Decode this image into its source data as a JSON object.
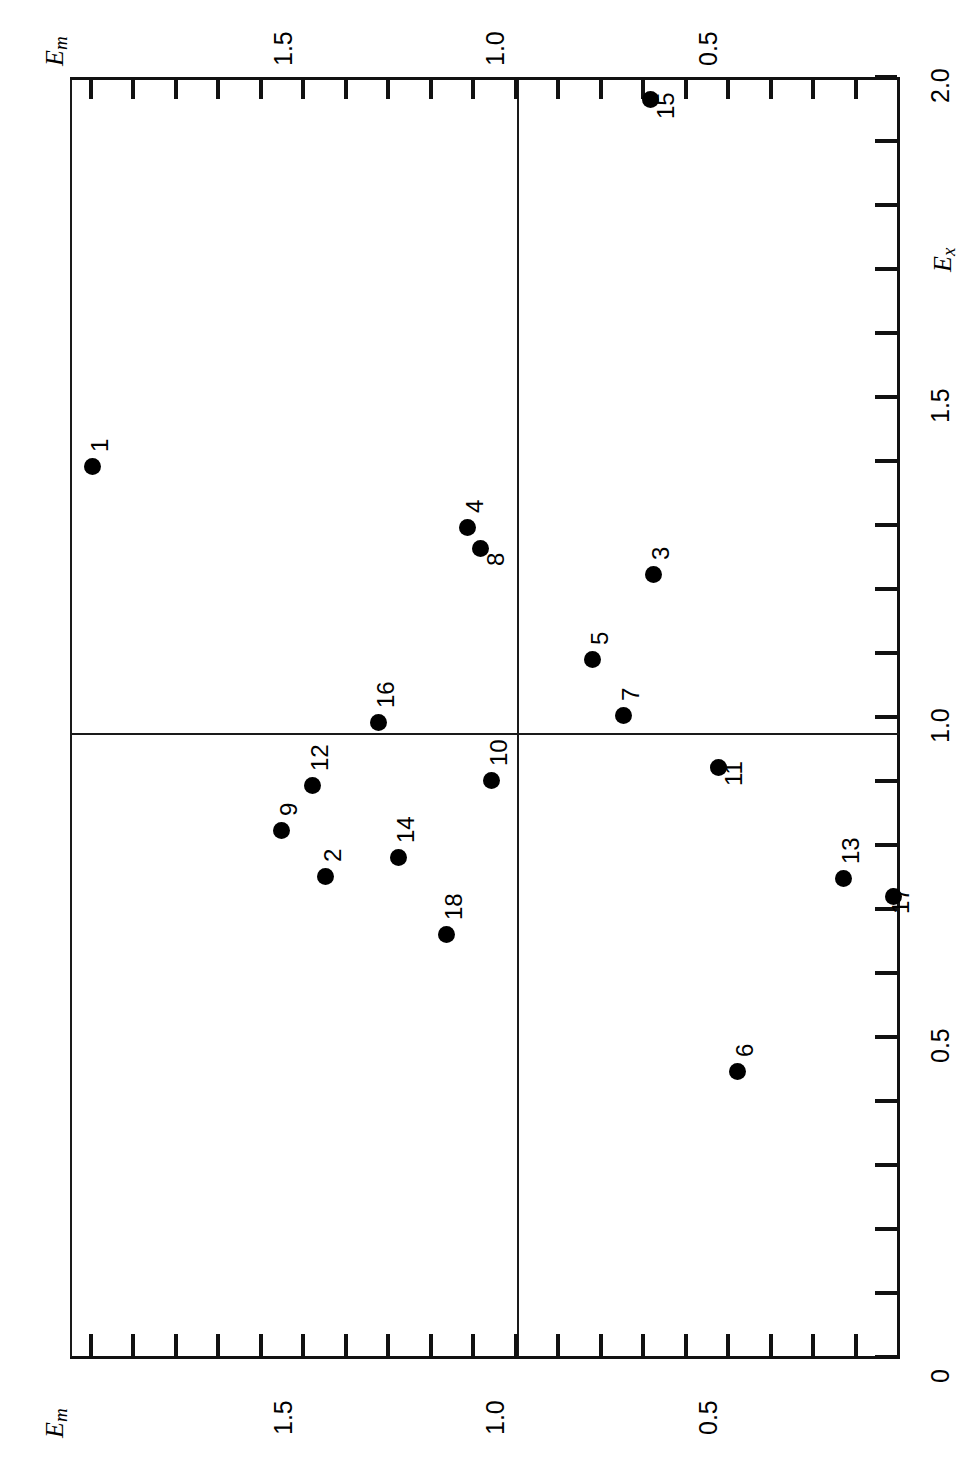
{
  "figure": {
    "orientation": "rotated-90",
    "background_color": "#ffffff",
    "ink_color": "#000000"
  },
  "axes": {
    "em_top": {
      "title": "E",
      "title_sub": "m",
      "labels": [
        "1.5",
        "1.0",
        "0.5"
      ]
    },
    "em_bottom": {
      "title": "E",
      "title_sub": "m",
      "labels": [
        "1.5",
        "1.0",
        "0.5"
      ]
    },
    "ex_right": {
      "title": "E",
      "title_sub": "x",
      "labels": [
        "2.0",
        "1.5",
        "1.0",
        "0.5",
        "0"
      ]
    }
  },
  "chart_data": {
    "type": "scatter",
    "title": "",
    "xlabel": "E_m",
    "ylabel": "E_x",
    "xlim": [
      0.0,
      1.95
    ],
    "ylim": [
      0.0,
      2.0
    ],
    "x_tick_labels": [
      "1.5",
      "1.0",
      "0.5"
    ],
    "x_tick_values": [
      1.5,
      1.0,
      0.5
    ],
    "y_tick_labels": [
      "2.0",
      "1.5",
      "1.0",
      "0.5",
      "0"
    ],
    "y_tick_values": [
      2.0,
      1.5,
      1.0,
      0.5,
      0.0
    ],
    "x_minor_tick_step": 0.1,
    "y_minor_tick_step": 0.1,
    "grid": false,
    "legend": false,
    "reference_lines": [
      {
        "axis": "x",
        "value": 1.0
      },
      {
        "axis": "y",
        "value": 1.0
      }
    ],
    "points": [
      {
        "label": "1",
        "x": 1.71,
        "y": 1.41,
        "label_pos": "above"
      },
      {
        "label": "2",
        "x": 1.31,
        "y": 0.89,
        "label_pos": "above"
      },
      {
        "label": "3",
        "x": 0.8,
        "y": 1.29,
        "label_pos": "above"
      },
      {
        "label": "4",
        "x": 1.05,
        "y": 1.35,
        "label_pos": "above"
      },
      {
        "label": "5",
        "x": 0.86,
        "y": 1.18,
        "label_pos": "above"
      },
      {
        "label": "6",
        "x": 0.64,
        "y": 0.47,
        "label_pos": "above"
      },
      {
        "label": "7",
        "x": 0.83,
        "y": 1.06,
        "label_pos": "above"
      },
      {
        "label": "8",
        "x": 1.02,
        "y": 1.32,
        "label_pos": "below"
      },
      {
        "label": "9",
        "x": 1.39,
        "y": 0.92,
        "label_pos": "above"
      },
      {
        "label": "10",
        "x": 1.05,
        "y": 0.96,
        "label_pos": "above"
      },
      {
        "label": "11",
        "x": 0.7,
        "y": 0.95,
        "label_pos": "below"
      },
      {
        "label": "12",
        "x": 1.33,
        "y": 0.97,
        "label_pos": "above"
      },
      {
        "label": "13",
        "x": 0.49,
        "y": 0.85,
        "label_pos": "above"
      },
      {
        "label": "14",
        "x": 1.19,
        "y": 0.88,
        "label_pos": "above"
      },
      {
        "label": "15",
        "x": 0.91,
        "y": 1.95,
        "label_pos": "below"
      },
      {
        "label": "16",
        "x": 1.09,
        "y": 1.01,
        "label_pos": "above"
      },
      {
        "label": "17",
        "x": 0.46,
        "y": 0.84,
        "label_pos": "below"
      },
      {
        "label": "18",
        "x": 1.11,
        "y": 0.82,
        "label_pos": "above"
      }
    ]
  },
  "geometry": {
    "x_px_at_0": 898,
    "x_px_per_unit": -425.0,
    "y_px_at_0": 1357,
    "y_px_per_unit": -640.0,
    "point_pixels": [
      {
        "label": "1",
        "px": 92,
        "py": 466,
        "lx": 88,
        "ly": 452
      },
      {
        "label": "2",
        "px": 325,
        "py": 876,
        "lx": 321,
        "ly": 862
      },
      {
        "label": "3",
        "px": 653,
        "py": 574,
        "lx": 649,
        "ly": 560
      },
      {
        "label": "4",
        "px": 467,
        "py": 527,
        "lx": 463,
        "ly": 513
      },
      {
        "label": "5",
        "px": 592,
        "py": 659,
        "lx": 588,
        "ly": 645
      },
      {
        "label": "6",
        "px": 737,
        "py": 1071,
        "lx": 733,
        "ly": 1057
      },
      {
        "label": "7",
        "px": 623,
        "py": 715,
        "lx": 619,
        "ly": 701
      },
      {
        "label": "8",
        "px": 480,
        "py": 548,
        "lx": 484,
        "ly": 566
      },
      {
        "label": "9",
        "px": 281,
        "py": 830,
        "lx": 277,
        "ly": 816
      },
      {
        "label": "10",
        "px": 491,
        "py": 780,
        "lx": 487,
        "ly": 766
      },
      {
        "label": "11",
        "px": 718,
        "py": 767,
        "lx": 722,
        "ly": 786
      },
      {
        "label": "12",
        "px": 312,
        "py": 785,
        "lx": 308,
        "ly": 771
      },
      {
        "label": "13",
        "px": 843,
        "py": 878,
        "lx": 839,
        "ly": 864
      },
      {
        "label": "14",
        "px": 398,
        "py": 857,
        "lx": 394,
        "ly": 843
      },
      {
        "label": "15",
        "px": 650,
        "py": 99,
        "lx": 654,
        "ly": 119
      },
      {
        "label": "16",
        "px": 378,
        "py": 722,
        "lx": 374,
        "ly": 708
      },
      {
        "label": "17",
        "px": 893,
        "py": 896,
        "lx": 889,
        "ly": 914
      },
      {
        "label": "18",
        "px": 446,
        "py": 934,
        "lx": 442,
        "ly": 920
      }
    ]
  }
}
